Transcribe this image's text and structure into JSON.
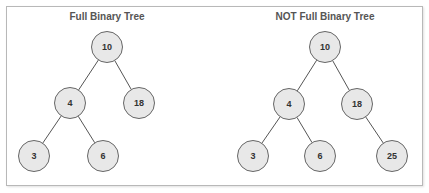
{
  "trees": [
    {
      "title": "Full Binary Tree",
      "title_pos": [
        107,
        20
      ],
      "nodes": [
        {
          "id": "a10",
          "label": "10",
          "x": 107,
          "y": 47
        },
        {
          "id": "a4",
          "label": "4",
          "x": 70,
          "y": 103
        },
        {
          "id": "a18",
          "label": "18",
          "x": 139,
          "y": 103
        },
        {
          "id": "a3",
          "label": "3",
          "x": 34,
          "y": 156
        },
        {
          "id": "a6",
          "label": "6",
          "x": 103,
          "y": 156
        }
      ],
      "edges": [
        [
          "a10",
          "a4"
        ],
        [
          "a10",
          "a18"
        ],
        [
          "a4",
          "a3"
        ],
        [
          "a4",
          "a6"
        ]
      ]
    },
    {
      "title": "NOT Full Binary Tree",
      "title_pos": [
        325,
        20
      ],
      "nodes": [
        {
          "id": "b10",
          "label": "10",
          "x": 325,
          "y": 47
        },
        {
          "id": "b4",
          "label": "4",
          "x": 289,
          "y": 104
        },
        {
          "id": "b18",
          "label": "18",
          "x": 357,
          "y": 104
        },
        {
          "id": "b3",
          "label": "3",
          "x": 253,
          "y": 156
        },
        {
          "id": "b6",
          "label": "6",
          "x": 320,
          "y": 156
        },
        {
          "id": "b25",
          "label": "25",
          "x": 392,
          "y": 156
        }
      ],
      "edges": [
        [
          "b10",
          "b4"
        ],
        [
          "b10",
          "b18"
        ],
        [
          "b4",
          "b3"
        ],
        [
          "b4",
          "b6"
        ],
        [
          "b18",
          "b25"
        ]
      ]
    }
  ],
  "node_radius": 15.5,
  "colors": {
    "node_fill": "#e8e8e8",
    "node_stroke": "#666666",
    "edge": "#555555",
    "title": "#555555",
    "frame": "#b8b8b8"
  }
}
